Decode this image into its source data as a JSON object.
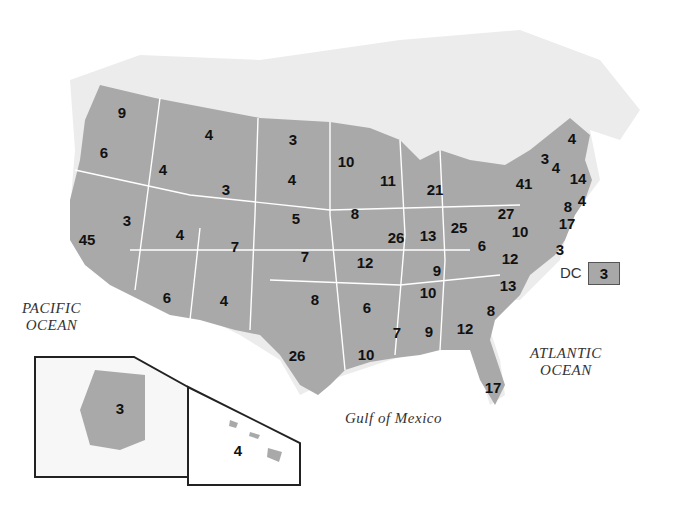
{
  "map": {
    "title": "Electoral votes by state",
    "fill_color": "#a9a9a9",
    "border_color": "#ffffff",
    "water_labels": {
      "pacific": [
        "PACIFIC",
        "OCEAN"
      ],
      "atlantic": [
        "ATLANTIC",
        "OCEAN"
      ],
      "gulf": "Gulf of Mexico"
    },
    "dc": {
      "label": "DC",
      "value": "3"
    },
    "states": [
      {
        "id": "WA",
        "value": "9",
        "x": 122,
        "y": 112
      },
      {
        "id": "OR",
        "value": "6",
        "x": 104,
        "y": 152
      },
      {
        "id": "ID",
        "value": "4",
        "x": 163,
        "y": 169
      },
      {
        "id": "MT",
        "value": "4",
        "x": 209,
        "y": 134
      },
      {
        "id": "WY",
        "value": "3",
        "x": 226,
        "y": 189
      },
      {
        "id": "ND",
        "value": "3",
        "x": 293,
        "y": 139
      },
      {
        "id": "SD",
        "value": "4",
        "x": 292,
        "y": 179
      },
      {
        "id": "NE",
        "value": "5",
        "x": 296,
        "y": 218
      },
      {
        "id": "KS",
        "value": "7",
        "x": 305,
        "y": 256
      },
      {
        "id": "OK",
        "value": "8",
        "x": 315,
        "y": 299
      },
      {
        "id": "TX",
        "value": "26",
        "x": 297,
        "y": 355
      },
      {
        "id": "NV",
        "value": "3",
        "x": 127,
        "y": 220
      },
      {
        "id": "CA",
        "value": "45",
        "x": 87,
        "y": 239
      },
      {
        "id": "UT",
        "value": "4",
        "x": 180,
        "y": 234
      },
      {
        "id": "CO",
        "value": "7",
        "x": 235,
        "y": 246
      },
      {
        "id": "AZ",
        "value": "6",
        "x": 167,
        "y": 297
      },
      {
        "id": "NM",
        "value": "4",
        "x": 224,
        "y": 300
      },
      {
        "id": "MN",
        "value": "10",
        "x": 346,
        "y": 161
      },
      {
        "id": "IA",
        "value": "8",
        "x": 355,
        "y": 213
      },
      {
        "id": "MO",
        "value": "12",
        "x": 365,
        "y": 262
      },
      {
        "id": "AR",
        "value": "6",
        "x": 367,
        "y": 307
      },
      {
        "id": "LA",
        "value": "10",
        "x": 366,
        "y": 354
      },
      {
        "id": "WI",
        "value": "11",
        "x": 388,
        "y": 180
      },
      {
        "id": "IL",
        "value": "26",
        "x": 396,
        "y": 237
      },
      {
        "id": "MI",
        "value": "21",
        "x": 435,
        "y": 189
      },
      {
        "id": "IN",
        "value": "13",
        "x": 428,
        "y": 235
      },
      {
        "id": "OH",
        "value": "25",
        "x": 459,
        "y": 227
      },
      {
        "id": "KY",
        "value": "9",
        "x": 437,
        "y": 270
      },
      {
        "id": "TN",
        "value": "10",
        "x": 428,
        "y": 292
      },
      {
        "id": "MS",
        "value": "7",
        "x": 397,
        "y": 332
      },
      {
        "id": "AL",
        "value": "9",
        "x": 429,
        "y": 331
      },
      {
        "id": "GA",
        "value": "12",
        "x": 465,
        "y": 328
      },
      {
        "id": "FL",
        "value": "17",
        "x": 493,
        "y": 387
      },
      {
        "id": "SC",
        "value": "8",
        "x": 491,
        "y": 310
      },
      {
        "id": "NC",
        "value": "13",
        "x": 508,
        "y": 285
      },
      {
        "id": "VA",
        "value": "12",
        "x": 510,
        "y": 258
      },
      {
        "id": "WV",
        "value": "6",
        "x": 482,
        "y": 245
      },
      {
        "id": "PA",
        "value": "27",
        "x": 506,
        "y": 213
      },
      {
        "id": "NY",
        "value": "41",
        "x": 524,
        "y": 183
      },
      {
        "id": "ME",
        "value": "4",
        "x": 572,
        "y": 138
      },
      {
        "id": "VT",
        "value": "3",
        "x": 545,
        "y": 158
      },
      {
        "id": "NH",
        "value": "4",
        "x": 556,
        "y": 167
      },
      {
        "id": "MA",
        "value": "14",
        "x": 578,
        "y": 178
      },
      {
        "id": "RI",
        "value": "4",
        "x": 582,
        "y": 200
      },
      {
        "id": "CT",
        "value": "8",
        "x": 568,
        "y": 206
      },
      {
        "id": "NJ",
        "value": "17",
        "x": 567,
        "y": 223
      },
      {
        "id": "MD",
        "value": "10",
        "x": 520,
        "y": 231
      },
      {
        "id": "DE",
        "value": "3",
        "x": 560,
        "y": 249
      },
      {
        "id": "AK",
        "value": "3",
        "x": 120,
        "y": 408
      },
      {
        "id": "HI",
        "value": "4",
        "x": 238,
        "y": 450
      }
    ]
  }
}
